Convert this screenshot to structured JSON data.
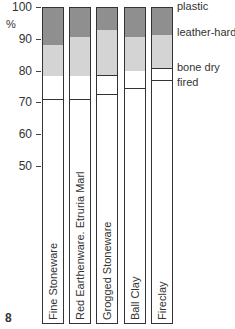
{
  "chart_data": {
    "type": "bar",
    "subtype": "stacked-range",
    "title": "",
    "xlabel": "",
    "ylabel": "%",
    "ylim": [
      50,
      100
    ],
    "yticks": [
      100,
      90,
      80,
      70,
      60,
      50
    ],
    "grid": false,
    "categories": [
      "Fine Stoneware",
      "Red Earthenware. Etruria Marl",
      "Grogged Stoneware",
      "Ball Clay",
      "Fireclay"
    ],
    "stages": [
      "plastic",
      "leather-hard",
      "bone dry",
      "fired"
    ],
    "series": [
      {
        "name": "plastic",
        "values": [
          100,
          100,
          100,
          100,
          100
        ]
      },
      {
        "name": "leather-hard",
        "values": [
          88,
          90.3,
          92.5,
          90.3,
          91
        ]
      },
      {
        "name": "bone dry",
        "values": [
          78,
          78,
          78.3,
          79.6,
          80.5
        ]
      },
      {
        "name": "fired",
        "values": [
          71,
          71,
          72.6,
          74.5,
          77
        ]
      }
    ],
    "legend": {
      "position": "right",
      "entries": [
        "plastic",
        "leather-hard",
        "bone dry",
        "fired"
      ]
    },
    "figure_number": "8"
  },
  "axis": {
    "unit": "%",
    "ticks": [
      "100",
      "90",
      "80",
      "70",
      "60",
      "50"
    ]
  },
  "stage_labels": {
    "plastic": "plastic",
    "leather": "leather-hard",
    "bone": "bone dry",
    "fired": "fired"
  },
  "bars": [
    {
      "label": "Fine Stoneware"
    },
    {
      "label": "Red Earthenware.  Etruria Marl"
    },
    {
      "label": "Grogged Stoneware"
    },
    {
      "label": "Ball Clay"
    },
    {
      "label": "Fireclay"
    }
  ],
  "figure_number": "8",
  "colors": {
    "plastic": "#8f8f8f",
    "leather_hard": "#d4d4d4",
    "bone_dry": "#ffffff",
    "outline": "#333333"
  }
}
